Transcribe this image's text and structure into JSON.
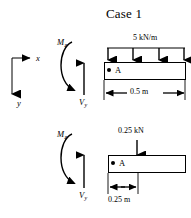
{
  "figure": {
    "title": "Case 1",
    "type": "engineering-free-body-diagram",
    "background_color": "#ffffff",
    "line_color": "#000000"
  },
  "axes": {
    "x_label": "x",
    "y_label": "y",
    "x_direction": "right",
    "y_direction": "down"
  },
  "case_top": {
    "load_label": "5 kN/m",
    "load_type": "uniformly-distributed",
    "arrow_count": 4,
    "point_label": "A",
    "moment_label": "M",
    "moment_subscript": "z",
    "shear_label": "V",
    "shear_subscript": "y",
    "dimension_label": "0.5 m"
  },
  "case_bottom": {
    "load_label": "0.25 kN",
    "load_type": "point-load",
    "arrow_count": 1,
    "point_label": "A",
    "moment_label": "M",
    "moment_subscript": "z",
    "shear_label": "V",
    "shear_subscript": "y",
    "dimension_label": "0.25 m"
  }
}
